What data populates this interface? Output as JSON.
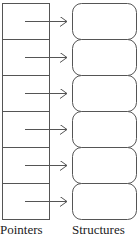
{
  "diagram": {
    "rows": 6,
    "labels": {
      "pointers": "Pointers",
      "structures": "Structures"
    },
    "colors": {
      "stroke": "#555555",
      "background": "#ffffff"
    }
  }
}
